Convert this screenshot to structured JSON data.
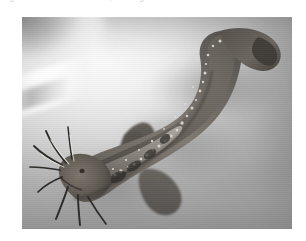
{
  "page": {
    "background_color": "#ffffff",
    "width": 306,
    "height": 241
  },
  "caption": {
    "text": "Fig. 1. — Clarias batrachus, walking catfish",
    "note": "cropped at top edge, illegible",
    "color": "#b9b9b9"
  },
  "photo": {
    "kind": "grayscale-photograph",
    "subject": "catfish",
    "alt": "Black and white photograph of a catfish with long barbels lying curved on a pale smooth surface",
    "x": 22,
    "y": 17,
    "width": 270,
    "height": 212,
    "palette": {
      "background_light": "#f7f7f7",
      "background_mid": "#bdbdbd",
      "background_dark": "#8f8f8f",
      "fish_body": "#6e6a65",
      "fish_dark": "#3a3733",
      "fish_highlight": "#cfcac2",
      "speckle": "#ece9e3",
      "barbel": "#2e2c29"
    },
    "elements": [
      {
        "name": "fish-body",
        "label": "curved fish body"
      },
      {
        "name": "fish-head",
        "label": "head, lower-left"
      },
      {
        "name": "fish-tail",
        "label": "caudal fin, upper-right"
      },
      {
        "name": "dorsal-fin",
        "label": "dorsal fin"
      },
      {
        "name": "pectoral-fin",
        "label": "pectoral fin"
      },
      {
        "name": "ventral-fin",
        "label": "ventral fin"
      },
      {
        "name": "barbels",
        "label": "eight barbels radiating from head"
      },
      {
        "name": "background-surface",
        "label": "pale smooth surface"
      }
    ]
  }
}
